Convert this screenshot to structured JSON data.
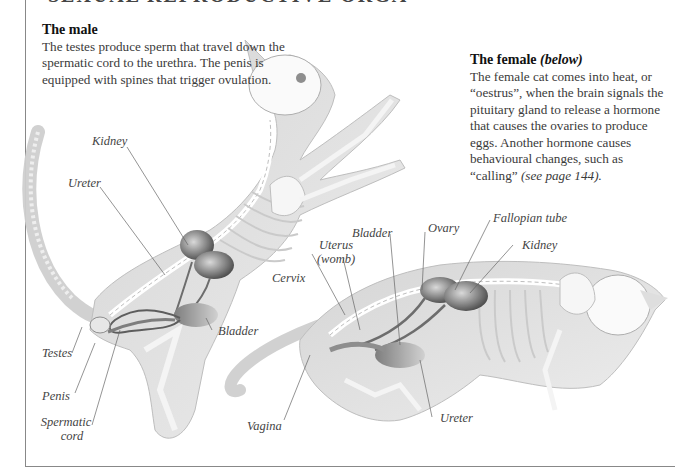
{
  "page": {
    "heading_partial": "SEXUAL REPRODUCTIVE ORGANS"
  },
  "male": {
    "title": "The male",
    "body": "The testes produce sperm that travel down the spermatic cord to the urethra. The penis is equipped with spines that trigger ovulation.",
    "labels": {
      "kidney": "Kidney",
      "ureter": "Ureter",
      "bladder": "Bladder",
      "testes": "Testes",
      "penis": "Penis",
      "spermatic_cord_line1": "Spermatic",
      "spermatic_cord_line2": "cord"
    }
  },
  "female": {
    "title": "The female",
    "title_suffix": "(below)",
    "body_main": "The female cat comes into heat, or “oestrus”, when the brain signals the pituitary gland to release a hormone that causes the ovaries to produce eggs. Another hormone causes behavioural changes, such as “calling” ",
    "body_ref": "(see page 144).",
    "labels": {
      "bladder": "Bladder",
      "ovary": "Ovary",
      "fallopian_tube": "Fallopian tube",
      "kidney": "Kidney",
      "uterus_line1": "Uterus",
      "uterus_line2": "(womb)",
      "cervix": "Cervix",
      "vagina": "Vagina",
      "ureter": "Ureter"
    }
  },
  "colors": {
    "frame": "#888888",
    "ink": "#333333",
    "organ": "#6e6e6e",
    "sketch": "#bdbdbd"
  }
}
